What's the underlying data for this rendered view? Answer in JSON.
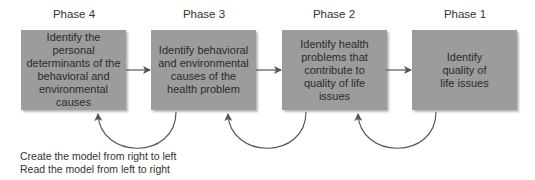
{
  "diagram": {
    "phases": [
      {
        "label": "Phase 4",
        "text": "Identify the personal determinants of the behavioral and environmental causes"
      },
      {
        "label": "Phase 3",
        "text": "Identify behavioral and environmental causes of the health problem"
      },
      {
        "label": "Phase 2",
        "text": "Identify health problems that contribute to quality of life issues"
      },
      {
        "label": "Phase 1",
        "text": "Identify quality of life issues"
      }
    ],
    "notes": {
      "line1": "Create the model from right to left",
      "line2": "Read the model from left to right"
    },
    "colors": {
      "box_fill": "#9c9c9c",
      "arrow": "#555555"
    }
  }
}
